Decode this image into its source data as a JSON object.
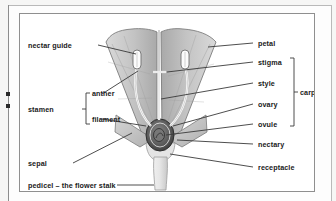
{
  "document": {
    "type": "botany-diagram",
    "title": "flower structure cross-section"
  },
  "labels": {
    "left": [
      {
        "id": "nectar-guide",
        "text": "nectar guide"
      },
      {
        "id": "stamen",
        "text": "stamen"
      },
      {
        "id": "anther",
        "text": "anther"
      },
      {
        "id": "filament",
        "text": "filament"
      },
      {
        "id": "sepal",
        "text": "sepal"
      },
      {
        "id": "pedicel",
        "text": "pedicel – the flower stalk"
      }
    ],
    "right": [
      {
        "id": "petal",
        "text": "petal"
      },
      {
        "id": "stigma",
        "text": "stigma"
      },
      {
        "id": "style",
        "text": "style"
      },
      {
        "id": "ovary",
        "text": "ovary"
      },
      {
        "id": "ovule",
        "text": "ovule"
      },
      {
        "id": "nectary",
        "text": "nectary"
      },
      {
        "id": "receptacle",
        "text": "receptacle"
      },
      {
        "id": "carpel",
        "text": "carpel"
      }
    ]
  },
  "colors": {
    "ink": "#1a1a1a",
    "leader": "#3a3a3a",
    "frame": "#8f8f8f",
    "outer_frame": "#b9b9b9",
    "page_bg": "#f6f6f5",
    "box_bg": "#ffffff",
    "petal_light": "#d8d8d8",
    "petal_mid": "#bdbdbd",
    "petal_dark": "#9b9b9b",
    "sepal": "#c9c9c9",
    "ovary_dark": "#4a4a4a",
    "ovule": "#6e6e6e",
    "stalk": "#e2e2e2"
  }
}
